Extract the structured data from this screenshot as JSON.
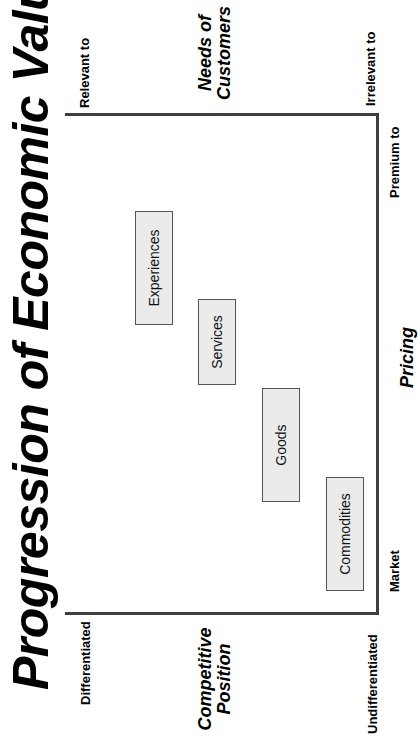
{
  "title": "Progression of Economic Value",
  "axes": {
    "competitive_position": {
      "title_line1": "Competitive",
      "title_line2": "Position",
      "start_label": "Differentiated",
      "end_label": "Undifferentiated"
    },
    "needs_of_customers": {
      "title_line1": "Needs of",
      "title_line2": "Customers",
      "start_label": "Relevant to",
      "end_label": "Irrelevant to"
    },
    "pricing": {
      "title": "Pricing",
      "start_label": "Market",
      "end_label": "Premium to"
    }
  },
  "stages": [
    {
      "label": "Experiences"
    },
    {
      "label": "Services"
    },
    {
      "label": "Goods"
    },
    {
      "label": "Commodities"
    }
  ],
  "colors": {
    "frame": "#3f3f3f",
    "box_fill": "#ebebeb",
    "box_border": "#555555"
  }
}
